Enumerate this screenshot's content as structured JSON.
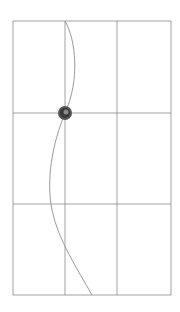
{
  "diagram": {
    "type": "sketch-grid-with-curve",
    "grid": {
      "columns": 3,
      "rows": 3,
      "bounds": {
        "left": 13,
        "top": 21,
        "right": 171,
        "bottom": 295
      },
      "vertical_lines_x": [
        65,
        117
      ],
      "horizontal_lines_y": [
        113,
        204
      ],
      "line_color": "#8a8a8a"
    },
    "curve": {
      "color": "#9a9a9a",
      "points": [
        [
          65,
          21
        ],
        [
          74,
          45
        ],
        [
          78,
          75
        ],
        [
          72,
          100
        ],
        [
          65,
          113
        ],
        [
          57,
          140
        ],
        [
          51,
          175
        ],
        [
          51,
          204
        ],
        [
          60,
          240
        ],
        [
          75,
          270
        ],
        [
          92,
          295
        ]
      ]
    },
    "marker": {
      "cx": 65,
      "cy": 113,
      "r": 7,
      "color": "#444444"
    }
  }
}
